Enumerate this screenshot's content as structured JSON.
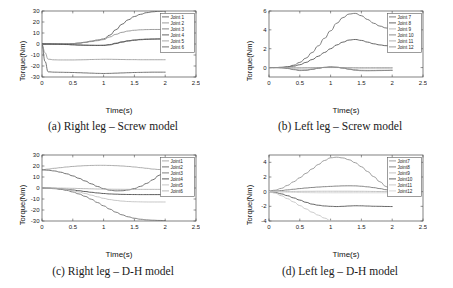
{
  "figure": {
    "panels": [
      {
        "id": "a",
        "caption": "(a) Right leg – Screw model",
        "xlabel": "Time(s)",
        "ylabel": "Torque(Nm)"
      },
      {
        "id": "b",
        "caption": "(b) Left leg – Screw model",
        "xlabel": "Time(s)",
        "ylabel": "Torque(Nm)"
      },
      {
        "id": "c",
        "caption": "(c) Right leg – D-H model",
        "xlabel": "Time(s)",
        "ylabel": "Torque(Nm)"
      },
      {
        "id": "d",
        "caption": "(d) Left leg – D-H model",
        "xlabel": "Time(s)",
        "ylabel": "Torque(Nm)"
      }
    ]
  },
  "chart_data": [
    {
      "panel": "a",
      "type": "line",
      "title": "(a) Right leg – Screw model",
      "xlabel": "Time(s)",
      "ylabel": "Torque(Nm)",
      "xlim": [
        0,
        2.5
      ],
      "ylim": [
        -30,
        30
      ],
      "xticks": [
        0,
        0.5,
        1,
        1.5,
        2,
        2.5
      ],
      "xticklabels": [
        "0",
        "0.5",
        "1",
        "1.5",
        "2",
        "2.5"
      ],
      "yticks": [
        -30,
        -20,
        -10,
        0,
        10,
        20,
        30
      ],
      "yticklabels": [
        "-30",
        "-20",
        "-10",
        "0",
        "10",
        "20",
        "30"
      ],
      "grid": false,
      "legend_position": "upper-right",
      "legend": [
        "Joint 1",
        "Joint 2",
        "Joint 3",
        "Joint 4",
        "Joint 5",
        "Joint 6"
      ],
      "x": [
        0,
        0.05,
        0.1,
        0.2,
        0.3,
        0.4,
        0.5,
        0.6,
        0.7,
        0.8,
        0.9,
        1.0,
        1.1,
        1.2,
        1.3,
        1.4,
        1.5,
        1.6,
        1.7,
        1.8,
        1.9,
        2.0
      ],
      "series": [
        {
          "name": "Joint 1",
          "color": "#555555",
          "values": [
            0,
            0,
            0,
            0,
            0.1,
            0.2,
            0.4,
            0.8,
            1.6,
            2.6,
            3.6,
            4.6,
            8.0,
            13.0,
            18.0,
            22.0,
            25.0,
            27.0,
            28.5,
            29.3,
            29.8,
            30.0
          ]
        },
        {
          "name": "Joint 2",
          "color": "#8c8c8c",
          "values": [
            0,
            0,
            0,
            0,
            0.1,
            0.2,
            0.4,
            0.8,
            1.4,
            2.2,
            3.0,
            4.0,
            6.4,
            8.8,
            10.6,
            11.8,
            12.5,
            12.9,
            13.1,
            13.2,
            13.2,
            13.1
          ]
        },
        {
          "name": "Joint 3",
          "color": "#6f6f6f",
          "values": [
            0,
            0,
            0,
            -0.1,
            -0.3,
            -0.5,
            -0.8,
            -1.0,
            -1.1,
            -1.2,
            -1.2,
            -1.1,
            -0.5,
            0.8,
            2.0,
            3.0,
            3.7,
            4.2,
            4.5,
            4.6,
            4.7,
            4.7
          ]
        },
        {
          "name": "Joint 4",
          "color": "#4a4a4a",
          "values": [
            0,
            0,
            0,
            -0.1,
            -0.2,
            -0.4,
            -0.6,
            -0.9,
            -1.1,
            -1.2,
            -1.3,
            -1.3,
            -0.8,
            0.4,
            1.7,
            2.7,
            3.4,
            3.9,
            4.2,
            4.4,
            4.5,
            4.5
          ]
        },
        {
          "name": "Joint 5",
          "color": "#9a9a9a",
          "values": [
            0,
            -8.0,
            -13.8,
            -14.4,
            -14.5,
            -14.5,
            -14.5,
            -14.4,
            -14.3,
            -14.1,
            -14.0,
            -13.9,
            -13.9,
            -14.0,
            -14.1,
            -14.2,
            -14.2,
            -14.3,
            -14.3,
            -14.3,
            -14.3,
            -14.3
          ]
        },
        {
          "name": "Joint 6",
          "color": "#5c5c5c",
          "values": [
            0,
            -16.0,
            -25.3,
            -25.6,
            -25.7,
            -25.8,
            -25.9,
            -26.1,
            -26.3,
            -26.5,
            -26.7,
            -26.8,
            -26.7,
            -26.5,
            -26.3,
            -26.1,
            -25.9,
            -25.8,
            -25.7,
            -25.6,
            -25.6,
            -25.6
          ]
        }
      ]
    },
    {
      "panel": "b",
      "type": "line",
      "title": "(b) Left leg – Screw model",
      "xlabel": "Time(s)",
      "ylabel": "Torque(Nm)",
      "xlim": [
        0,
        2.5
      ],
      "ylim": [
        -1.0,
        6.0
      ],
      "xticks": [
        0,
        0.5,
        1,
        1.5,
        2,
        2.5
      ],
      "xticklabels": [
        "0",
        "0.5",
        "1",
        "1.5",
        "2",
        "2.5"
      ],
      "yticks": [
        0,
        2,
        4,
        6
      ],
      "yticklabels": [
        "0",
        "2",
        "4",
        "6"
      ],
      "grid": false,
      "legend_position": "upper-right",
      "legend": [
        "Joint 7",
        "Joint 8",
        "Joint 9",
        "Joint 10",
        "Joint 11",
        "Joint 12"
      ],
      "x": [
        0,
        0.1,
        0.2,
        0.3,
        0.4,
        0.5,
        0.6,
        0.7,
        0.8,
        0.9,
        1.0,
        1.1,
        1.2,
        1.3,
        1.4,
        1.5,
        1.6,
        1.7,
        1.8,
        1.9,
        2.0
      ],
      "series": [
        {
          "name": "Joint 7",
          "color": "#666666",
          "values": [
            0,
            0,
            0.02,
            0.08,
            0.25,
            0.55,
            1.0,
            1.6,
            2.3,
            3.1,
            3.9,
            4.7,
            5.3,
            5.68,
            5.75,
            5.5,
            5.1,
            4.7,
            4.4,
            4.2,
            4.1
          ]
        },
        {
          "name": "Joint 8",
          "color": "#4d4d4d",
          "values": [
            0,
            0,
            0.02,
            0.06,
            0.15,
            0.3,
            0.55,
            0.85,
            1.2,
            1.6,
            2.0,
            2.4,
            2.7,
            2.92,
            2.98,
            2.88,
            2.7,
            2.52,
            2.4,
            2.32,
            2.3
          ]
        },
        {
          "name": "Joint 9",
          "color": "#b0b0b0",
          "values": [
            0,
            0,
            0,
            0,
            0,
            0,
            0,
            0,
            0,
            0,
            0,
            0,
            0,
            0,
            0,
            0,
            0,
            0,
            0,
            0,
            0
          ]
        },
        {
          "name": "Joint 10",
          "color": "#7a7a7a",
          "values": [
            0,
            0,
            -0.02,
            -0.1,
            -0.22,
            -0.32,
            -0.3,
            -0.2,
            -0.08,
            0.02,
            0.08,
            0.04,
            -0.06,
            -0.18,
            -0.28,
            -0.33,
            -0.34,
            -0.33,
            -0.32,
            -0.31,
            -0.3
          ]
        },
        {
          "name": "Joint 11",
          "color": "#a3a3a3",
          "values": [
            0,
            0,
            -0.01,
            -0.03,
            -0.05,
            -0.06,
            -0.05,
            -0.03,
            -0.01,
            0.01,
            0.02,
            0.01,
            -0.01,
            -0.03,
            -0.05,
            -0.06,
            -0.06,
            -0.06,
            -0.06,
            -0.06,
            -0.06
          ]
        },
        {
          "name": "Joint 12",
          "color": "#8a8a8a",
          "values": [
            0,
            0,
            -0.02,
            -0.08,
            -0.18,
            -0.26,
            -0.25,
            -0.16,
            -0.06,
            0.02,
            0.06,
            0.03,
            -0.05,
            -0.15,
            -0.24,
            -0.29,
            -0.3,
            -0.3,
            -0.29,
            -0.29,
            -0.28
          ]
        }
      ]
    },
    {
      "panel": "c",
      "type": "line",
      "title": "(c) Right leg – D-H model",
      "xlabel": "Time(s)",
      "ylabel": "Torque(Nm)",
      "xlim": [
        0,
        2.5
      ],
      "ylim": [
        -30,
        30
      ],
      "xticks": [
        0,
        0.5,
        1,
        1.5,
        2,
        2.5
      ],
      "xticklabels": [
        "0",
        "0.5",
        "1",
        "1.5",
        "2",
        "2.5"
      ],
      "yticks": [
        -30,
        -20,
        -10,
        0,
        10,
        20,
        30
      ],
      "yticklabels": [
        "-30",
        "-20",
        "-10",
        "0",
        "10",
        "20",
        "30"
      ],
      "grid": false,
      "legend_position": "upper-right",
      "legend": [
        "Joint1",
        "Joint2",
        "Joint3",
        "Joint4",
        "Joint5",
        "Joint6"
      ],
      "x": [
        0,
        0.1,
        0.2,
        0.3,
        0.4,
        0.5,
        0.6,
        0.7,
        0.8,
        0.9,
        1.0,
        1.1,
        1.2,
        1.3,
        1.4,
        1.5,
        1.6,
        1.7,
        1.8,
        1.9,
        2.0
      ],
      "series": [
        {
          "name": "Joint1",
          "color": "#9e9e9e",
          "values": [
            16.5,
            17.2,
            17.9,
            18.5,
            19.1,
            19.6,
            20.0,
            20.3,
            20.5,
            20.6,
            20.6,
            20.5,
            20.3,
            20.0,
            19.6,
            19.1,
            18.5,
            17.9,
            17.2,
            16.8,
            16.5
          ]
        },
        {
          "name": "Joint2",
          "color": "#5a5a5a",
          "values": [
            16.5,
            16.2,
            15.5,
            14.4,
            12.9,
            11.0,
            8.8,
            6.4,
            3.8,
            1.4,
            -0.6,
            -2.0,
            -2.6,
            -2.5,
            -1.8,
            -0.5,
            1.5,
            4.2,
            7.5,
            11.5,
            16.3
          ]
        },
        {
          "name": "Joint3",
          "color": "#6b6b6b",
          "values": [
            0,
            -0.2,
            -0.6,
            -1.2,
            -2.2,
            -3.6,
            -5.4,
            -7.6,
            -10.2,
            -13.2,
            -16.2,
            -19.2,
            -22.0,
            -24.4,
            -26.2,
            -27.5,
            -28.4,
            -29.0,
            -29.3,
            -29.5,
            -29.6
          ]
        },
        {
          "name": "Joint4",
          "color": "#3f3f3f",
          "values": [
            0,
            -0.1,
            -0.3,
            -0.7,
            -1.2,
            -1.8,
            -2.5,
            -3.2,
            -3.9,
            -4.5,
            -5.0,
            -5.4,
            -5.6,
            -5.8,
            -5.9,
            -5.95,
            -6.0,
            -6.0,
            -6.0,
            -6.0,
            -6.0
          ]
        },
        {
          "name": "Joint5",
          "color": "#bdbdbd",
          "values": [
            0,
            -0.1,
            -0.3,
            -0.7,
            -1.4,
            -2.4,
            -3.6,
            -5.0,
            -6.5,
            -8.0,
            -9.4,
            -10.5,
            -11.3,
            -11.9,
            -12.3,
            -12.5,
            -12.6,
            -12.7,
            -12.7,
            -12.7,
            -12.7
          ]
        },
        {
          "name": "Joint6",
          "color": "#adadad",
          "values": [
            0,
            0,
            -0.05,
            -0.1,
            -0.2,
            -0.3,
            -0.45,
            -0.6,
            -0.75,
            -0.9,
            -1.0,
            -1.1,
            -1.15,
            -1.2,
            -1.22,
            -1.25,
            -1.25,
            -1.25,
            -1.25,
            -1.25,
            -1.25
          ]
        }
      ]
    },
    {
      "panel": "d",
      "type": "line",
      "title": "(d) Left leg – D-H model",
      "xlabel": "Time(s)",
      "ylabel": "Torque(Nm)",
      "xlim": [
        0,
        2.5
      ],
      "ylim": [
        -4,
        5
      ],
      "xticks": [
        0,
        0.5,
        1,
        1.5,
        2,
        2.5
      ],
      "xticklabels": [
        "0",
        "0.5",
        "1",
        "1.5",
        "2",
        "2.5"
      ],
      "yticks": [
        -4,
        -2,
        0,
        2,
        4
      ],
      "yticklabels": [
        "-4",
        "-2",
        "0",
        "2",
        "4"
      ],
      "grid": false,
      "legend_position": "upper-right",
      "legend": [
        "Joint7",
        "Joint8",
        "Joint9",
        "Joint10",
        "Joint11",
        "Joint12"
      ],
      "x": [
        0,
        0.1,
        0.2,
        0.3,
        0.4,
        0.5,
        0.6,
        0.7,
        0.8,
        0.9,
        1.0,
        1.1,
        1.2,
        1.3,
        1.4,
        1.5,
        1.6,
        1.7,
        1.8,
        1.9,
        2.0
      ],
      "series": [
        {
          "name": "Joint7",
          "color": "#8f8f8f",
          "values": [
            0.1,
            0.2,
            0.45,
            0.85,
            1.35,
            1.9,
            2.5,
            3.1,
            3.7,
            4.25,
            4.62,
            4.7,
            4.6,
            4.35,
            3.95,
            3.4,
            2.75,
            2.05,
            1.35,
            0.7,
            0.15
          ]
        },
        {
          "name": "Joint8",
          "color": "#707070",
          "values": [
            0.05,
            0.08,
            0.15,
            0.24,
            0.33,
            0.42,
            0.5,
            0.57,
            0.63,
            0.68,
            0.72,
            0.76,
            0.79,
            0.8,
            0.79,
            0.74,
            0.66,
            0.55,
            0.42,
            0.27,
            0.12
          ]
        },
        {
          "name": "Joint9",
          "color": "#b8b8b8",
          "values": [
            0,
            0,
            0.01,
            0.02,
            0.03,
            0.04,
            0.05,
            0.05,
            0.06,
            0.06,
            0.06,
            0.06,
            0.06,
            0.06,
            0.05,
            0.05,
            0.04,
            0.03,
            0.02,
            0.01,
            0.0
          ]
        },
        {
          "name": "Joint10",
          "color": "#4a4a4a",
          "values": [
            0,
            -0.1,
            -0.3,
            -0.55,
            -0.85,
            -1.15,
            -1.45,
            -1.7,
            -1.85,
            -1.95,
            -2.0,
            -2.03,
            -2.0,
            -1.95,
            -1.92,
            -1.93,
            -1.96,
            -1.99,
            -2.0,
            -2.02,
            -2.03
          ]
        },
        {
          "name": "Joint11",
          "color": "#c2c2c2",
          "values": [
            0,
            -0.2,
            -0.55,
            -0.95,
            -1.4,
            -1.9,
            -2.35,
            -2.8,
            -3.2,
            -3.6,
            -3.95,
            -4.0,
            -4.0,
            -4.0,
            -4.0,
            -4.0,
            -4.0,
            -4.0,
            -4.0,
            -4.0,
            -4.0
          ]
        },
        {
          "name": "Joint12",
          "color": "#d0d0d0",
          "values": [
            0,
            -0.02,
            -0.05,
            -0.08,
            -0.1,
            -0.12,
            -0.13,
            -0.14,
            -0.15,
            -0.15,
            -0.15,
            -0.15,
            -0.15,
            -0.15,
            -0.15,
            -0.15,
            -0.15,
            -0.15,
            -0.15,
            -0.15,
            -0.15
          ]
        }
      ]
    }
  ]
}
